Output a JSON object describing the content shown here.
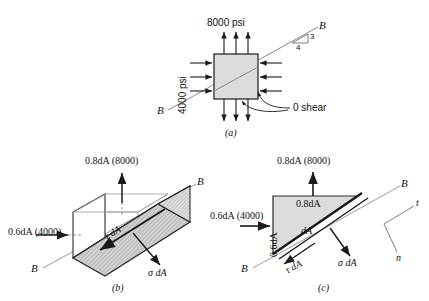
{
  "figure": {
    "background_color": "#ffffff",
    "ink_color": "#1a1a1a",
    "fill_gray": "#d9d9d9",
    "hatch_gray": "#bdbdbd"
  },
  "panel_a": {
    "caption": "(a)",
    "top_stress": "8000 psi",
    "left_stress": "4000 psi",
    "shear_note": "0 shear",
    "section_label_upper": "B",
    "section_label_lower": "B",
    "slope_rise": "3",
    "slope_run": "4",
    "arrow_count_per_side": 3
  },
  "panel_b": {
    "caption": "(b)",
    "normal_force_top": "0.8dA (8000)",
    "normal_force_left": "0.6dA (4000)",
    "shear_force": "τ dA",
    "normal_stress_force": "σ dA",
    "section_label_upper": "B",
    "section_label_lower": "B"
  },
  "panel_c": {
    "caption": "(c)",
    "normal_force_top": "0.8dA (8000)",
    "normal_force_left": "0.6dA (4000)",
    "face_label_top": "0.8dA",
    "face_label_left": "0.6dA",
    "area_label": "dA",
    "shear_force": "τ dA",
    "normal_stress_force": "σ dA",
    "section_label_upper": "B",
    "section_label_lower": "B",
    "axis_t": "t",
    "axis_n": "n"
  }
}
